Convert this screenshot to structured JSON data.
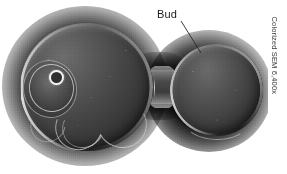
{
  "figure": {
    "kind": "scanning-electron-micrograph",
    "width": 287,
    "height": 174
  },
  "annotations": {
    "bud": {
      "label": "Bud",
      "leader_from": {
        "x": 181,
        "y": 21
      },
      "leader_to": {
        "x": 201,
        "y": 53
      }
    }
  },
  "credit": {
    "text": "Colorized SEM 6,400x",
    "technique": "Colorized SEM",
    "magnification": "6,400x",
    "orientation": "vertical"
  },
  "structures": [
    {
      "name": "mother-cell",
      "label": ""
    },
    {
      "name": "bud-cell",
      "label": ""
    },
    {
      "name": "neck",
      "label": ""
    },
    {
      "name": "bud-scar",
      "label": ""
    }
  ],
  "colors": {
    "background": "#ffffff",
    "cell_highlight": "#6d6d6d",
    "cell_midtone": "#474747",
    "cell_shadow": "#222222",
    "halo": "#000000",
    "label_text": "#1b1b1b",
    "credit_text": "#3a3a3a",
    "rim_highlight": "#ffffff",
    "scar_pore": "#f2f2f2"
  }
}
